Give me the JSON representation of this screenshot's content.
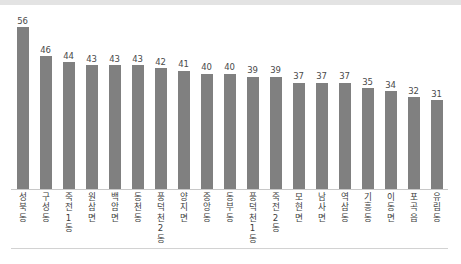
{
  "page": {
    "background_color": "#ffffff",
    "top_band_color": "#e3e3e3",
    "bottom_rule_color": "#d2d2d2"
  },
  "chart_data": {
    "type": "bar",
    "title": "",
    "subtitle": "",
    "xlabel": "",
    "ylabel": "",
    "grid": false,
    "legend": false,
    "bar_color": "#808080",
    "value_label_color": "#4a4a4a",
    "axis_line_color": "#c8c8c8",
    "ylim": [
      0,
      62
    ],
    "categories": [
      "성북동",
      "구성동",
      "죽전1동",
      "원삼면",
      "백암면",
      "동천동",
      "풍덕천2동",
      "양지면",
      "중앙동",
      "동부동",
      "풍덕천1동",
      "죽전2동",
      "모현면",
      "남사면",
      "역삼동",
      "기흥동",
      "이동면",
      "포곡읍",
      "유림동"
    ],
    "values": [
      56,
      46,
      44,
      43,
      43,
      43,
      42,
      41,
      40,
      40,
      39,
      39,
      37,
      37,
      37,
      35,
      34,
      32,
      31
    ],
    "value_labels": [
      "56",
      "46",
      "44",
      "43",
      "43",
      "43",
      "42",
      "41",
      "40",
      "40",
      "39",
      "39",
      "37",
      "37",
      "37",
      "35",
      "34",
      "32",
      "31"
    ]
  }
}
